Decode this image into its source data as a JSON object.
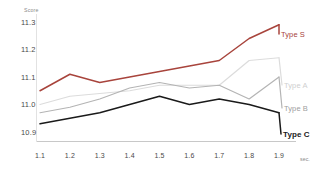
{
  "chart_data": {
    "type": "line",
    "title": "",
    "xlabel": "sec.",
    "ylabel": "Score",
    "x": [
      1.1,
      1.2,
      1.3,
      1.4,
      1.5,
      1.6,
      1.7,
      1.8,
      1.9
    ],
    "categories": [
      "1.1",
      "1.2",
      "1.3",
      "1.4",
      "1.5",
      "1.6",
      "1.7",
      "1.8",
      "1.9"
    ],
    "xlim": [
      1.1,
      1.9
    ],
    "ylim": [
      10.9,
      11.3
    ],
    "yticks": [
      "11.3",
      "11.2",
      "11.1",
      "11.0",
      "10.9"
    ],
    "ytick_values": [
      11.3,
      11.2,
      11.1,
      11.0,
      10.9
    ],
    "grid": false,
    "legend_position": "inline-right",
    "series": [
      {
        "name": "Type S",
        "color": "#a8443c",
        "values": [
          11.05,
          11.11,
          11.08,
          11.1,
          11.12,
          11.14,
          11.16,
          11.24,
          11.29
        ]
      },
      {
        "name": "Type A",
        "color": "#dcdcdc",
        "values": [
          11.0,
          11.03,
          11.04,
          11.05,
          11.07,
          11.07,
          11.07,
          11.16,
          11.17
        ]
      },
      {
        "name": "Type B",
        "color": "#b4b4b4",
        "values": [
          10.97,
          10.99,
          11.02,
          11.06,
          11.08,
          11.06,
          11.07,
          11.02,
          11.1
        ]
      },
      {
        "name": "Type C",
        "color": "#1a1a1a",
        "values": [
          10.93,
          10.95,
          10.97,
          11.0,
          11.03,
          11.0,
          11.02,
          11.0,
          10.97
        ]
      }
    ]
  },
  "axes": {
    "y_title": "Score",
    "x_unit": "sec."
  }
}
